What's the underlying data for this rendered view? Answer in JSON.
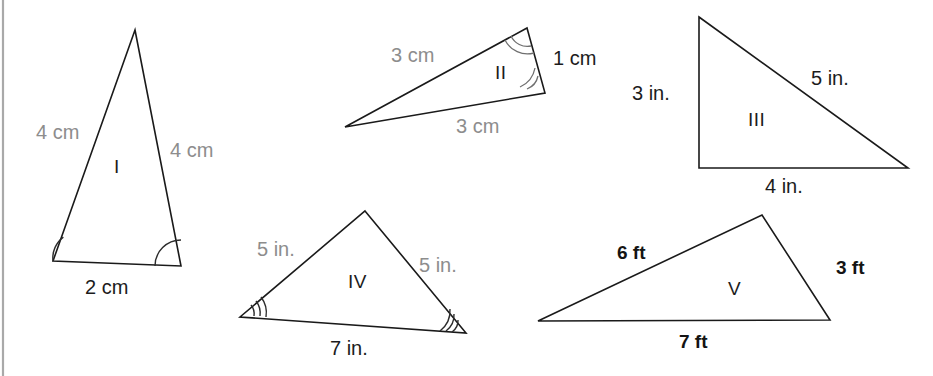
{
  "figure": {
    "background_color": "#ffffff",
    "left_border_color": "#a9a9a9",
    "gray_label_color": "#8d8d8d",
    "black_label_color": "#1c1c1c",
    "stroke_color": "#1a1a1a"
  },
  "triangles": [
    {
      "id": "I",
      "name": "triangle-1",
      "roman_label": "I",
      "unit": "cm",
      "side_labels": [
        {
          "text": "4 cm",
          "style": "gray",
          "position": "left"
        },
        {
          "text": "4 cm",
          "style": "gray",
          "position": "right"
        },
        {
          "text": "2 cm",
          "style": "black",
          "position": "base"
        }
      ],
      "angle_marks": 1,
      "marked_angles": 2
    },
    {
      "id": "II",
      "name": "triangle-2",
      "roman_label": "II",
      "unit": "cm",
      "side_labels": [
        {
          "text": "3 cm",
          "style": "gray",
          "position": "upper-left"
        },
        {
          "text": "1 cm",
          "style": "black",
          "position": "right"
        },
        {
          "text": "3 cm",
          "style": "gray",
          "position": "lower"
        }
      ],
      "angle_marks": 2,
      "marked_angles": 2
    },
    {
      "id": "III",
      "name": "triangle-3",
      "roman_label": "III",
      "unit": "in.",
      "side_labels": [
        {
          "text": "3 in.",
          "style": "black",
          "position": "left"
        },
        {
          "text": "5 in.",
          "style": "black",
          "position": "hypotenuse"
        },
        {
          "text": "4 in.",
          "style": "black",
          "position": "base"
        }
      ],
      "angle_marks": 0,
      "marked_angles": 0
    },
    {
      "id": "IV",
      "name": "triangle-4",
      "roman_label": "IV",
      "unit": "in.",
      "side_labels": [
        {
          "text": "5 in.",
          "style": "gray",
          "position": "left"
        },
        {
          "text": "5 in.",
          "style": "gray",
          "position": "right"
        },
        {
          "text": "7 in.",
          "style": "black",
          "position": "base"
        }
      ],
      "angle_marks": 3,
      "marked_angles": 2
    },
    {
      "id": "V",
      "name": "triangle-5",
      "roman_label": "V",
      "unit": "ft",
      "side_labels": [
        {
          "text": "6 ft",
          "style": "bold",
          "position": "upper-left"
        },
        {
          "text": "3 ft",
          "style": "bold",
          "position": "right"
        },
        {
          "text": "7 ft",
          "style": "bold",
          "position": "base"
        }
      ],
      "angle_marks": 0,
      "marked_angles": 0
    }
  ],
  "labels": {
    "t1_left": "4 cm",
    "t1_right": "4 cm",
    "t1_base": "2 cm",
    "t1_roman": "I",
    "t2_upper": "3 cm",
    "t2_right": "1 cm",
    "t2_lower": "3 cm",
    "t2_roman": "II",
    "t3_left": "3 in.",
    "t3_hyp": "5 in.",
    "t3_base": "4 in.",
    "t3_roman": "III",
    "t4_left": "5 in.",
    "t4_right": "5 in.",
    "t4_base": "7 in.",
    "t4_roman": "IV",
    "t5_upper": "6 ft",
    "t5_right": "3 ft",
    "t5_base": "7 ft",
    "t5_roman": "V"
  }
}
